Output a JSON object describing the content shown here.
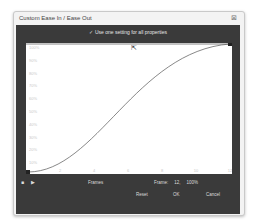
{
  "window": {
    "title": "Custom Ease In / Ease Out",
    "close_icon": "close-icon"
  },
  "options": {
    "checkbox_checked": true,
    "checkbox_label": "Use one setting for all properties"
  },
  "graph": {
    "y_labels": [
      "100%",
      "90%",
      "80%",
      "70%",
      "60%",
      "50%",
      "40%",
      "30%",
      "20%",
      "10%"
    ],
    "x_labels": [
      "2",
      "4",
      "6",
      "8",
      "10",
      "12"
    ],
    "x_axis_label": "Frames",
    "curve_color": "#555555"
  },
  "controls": {
    "stop_icon": "stop-icon",
    "play_icon": "play-icon",
    "frame_label": "Frame:",
    "frame_value": "12,",
    "percent_value": "100%"
  },
  "buttons": {
    "reset": "Reset",
    "ok": "OK",
    "cancel": "Cancel"
  }
}
